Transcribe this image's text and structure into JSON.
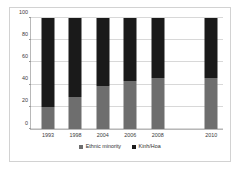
{
  "chart_data": {
    "type": "bar",
    "subtype": "stacked-100-percent",
    "title": "",
    "xlabel": "",
    "ylabel": "",
    "ylim": [
      0,
      100
    ],
    "yticks": [
      0,
      20,
      40,
      60,
      80,
      100
    ],
    "grid": true,
    "legend_position": "bottom",
    "categories": [
      "1993",
      "1998",
      "2004",
      "2006",
      "2008",
      "2010"
    ],
    "series": [
      {
        "name": "Ethnic minority",
        "color": "#6e6e6e",
        "values": [
          20,
          29,
          39,
          43,
          46,
          46
        ]
      },
      {
        "name": "Kinh/Hoa",
        "color": "#1a1a1a",
        "values": [
          80,
          71,
          61,
          57,
          54,
          54
        ]
      }
    ]
  },
  "legend": {
    "items": [
      {
        "label": "Ethnic minority"
      },
      {
        "label": "Kinh/Hoa"
      }
    ]
  }
}
